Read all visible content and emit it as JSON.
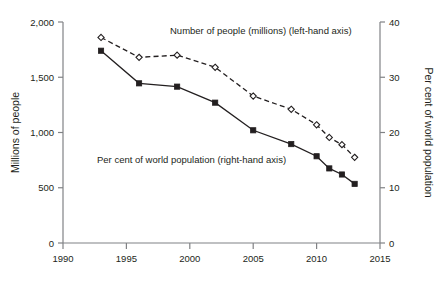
{
  "chart_data": {
    "type": "line",
    "title": "",
    "subtitle": "",
    "xlabel": "",
    "ylabel": "Millions of people",
    "y2label": "Per cent of world population",
    "xlim": [
      1990,
      2015
    ],
    "ylim": [
      0,
      2000
    ],
    "y2lim": [
      0,
      40
    ],
    "grid": false,
    "legend_position": "inline-annotation",
    "x_ticks": [
      "1990",
      "1995",
      "2000",
      "2005",
      "2010",
      "2015"
    ],
    "x_tick_values": [
      1990,
      1995,
      2000,
      2005,
      2010,
      2015
    ],
    "y_ticks": [
      "0",
      "500",
      "1,000",
      "1,500",
      "2,000"
    ],
    "y_tick_values": [
      0,
      500,
      1000,
      1500,
      2000
    ],
    "y2_ticks": [
      "0",
      "10",
      "20",
      "30",
      "40"
    ],
    "y2_tick_values": [
      0,
      10,
      20,
      30,
      40
    ],
    "x": [
      1993,
      1996,
      1999,
      2002,
      2005,
      2008,
      2010,
      2011,
      2012,
      2013
    ],
    "series": [
      {
        "name": "Number of people (millions) (left-hand axis)",
        "axis": "left",
        "marker": "square-filled",
        "line_style": "solid",
        "color": "#231f20",
        "values": [
          1740,
          1445,
          1415,
          1270,
          1020,
          895,
          785,
          675,
          620,
          535
        ]
      },
      {
        "name": "Per cent of world population (right-hand axis)",
        "axis": "right",
        "marker": "diamond-open",
        "line_style": "dashed",
        "color": "#231f20",
        "values": [
          37.2,
          33.6,
          34.0,
          31.8,
          26.6,
          24.2,
          21.4,
          19.1,
          17.8,
          15.5
        ]
      }
    ],
    "annotations": [
      {
        "name": "series-label-number-of-people",
        "text": "Number of people (millions) (left-hand axis)",
        "x": 170,
        "y": 34
      },
      {
        "name": "series-label-per-cent",
        "text": "Per cent of world population (right-hand axis)",
        "x": 97,
        "y": 163
      }
    ]
  }
}
